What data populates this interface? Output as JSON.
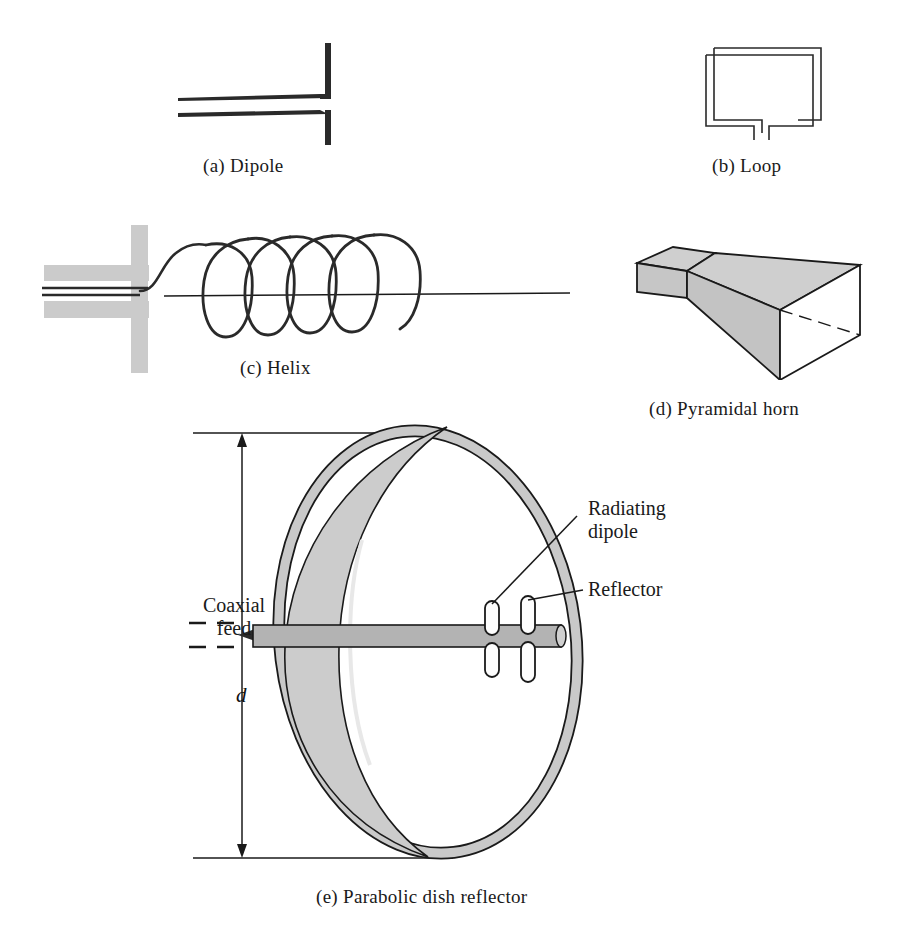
{
  "figure": {
    "background_color": "#ffffff",
    "line_color": "#1a1a1a",
    "shade_color": "#c9c9c9",
    "shade_color_light": "#d8d8d8",
    "shade_color_dark": "#a8a8a8"
  },
  "panels": [
    {
      "id": "a",
      "caption": "(a) Dipole",
      "name": "dipole"
    },
    {
      "id": "b",
      "caption": "(b) Loop",
      "name": "loop"
    },
    {
      "id": "c",
      "caption": "(c) Helix",
      "name": "helix"
    },
    {
      "id": "d",
      "caption": "(d) Pyramidal horn",
      "name": "pyramidal-horn"
    },
    {
      "id": "e",
      "caption": "(e) Parabolic dish reflector",
      "name": "parabolic-dish-reflector"
    }
  ],
  "dish_labels": {
    "radiating_dipole": "Radiating\ndipole",
    "reflector": "Reflector",
    "coaxial_feed": "Coaxial\nfeed",
    "diameter_symbol": "d"
  }
}
